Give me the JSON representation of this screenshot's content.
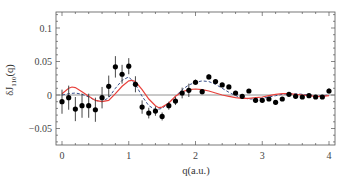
{
  "chart_data": {
    "type": "scatter",
    "title": "",
    "xlabel": "q(a.u.)",
    "ylabel": "δJ110(q)",
    "ylabel_main": "δJ",
    "ylabel_sub": "110",
    "ylabel_tail": "(q)",
    "xlim": [
      -0.08,
      4.1
    ],
    "ylim": [
      -0.075,
      0.125
    ],
    "grid": false,
    "legend": null,
    "x_ticks": [
      0,
      1,
      2,
      3,
      4
    ],
    "x_tick_labels": [
      "0",
      "1",
      "2",
      "3",
      "4"
    ],
    "y_ticks": [
      -0.05,
      0,
      0.05,
      0.1
    ],
    "y_tick_labels": [
      "-0.05",
      "0",
      "0.05",
      "0.1"
    ],
    "zero_line": true,
    "colors": {
      "data": "#000000",
      "model_solid": "#e8413c",
      "model_dashed": "#3a4f8a",
      "zero_line": "#777777",
      "frame": "#555555"
    },
    "series": [
      {
        "name": "experiment",
        "style": "points-with-errorbars",
        "x": [
          0.0,
          0.1,
          0.2,
          0.3,
          0.4,
          0.5,
          0.6,
          0.7,
          0.8,
          0.9,
          1.0,
          1.1,
          1.2,
          1.3,
          1.4,
          1.5,
          1.6,
          1.7,
          1.8,
          1.9,
          2.0,
          2.1,
          2.2,
          2.3,
          2.4,
          2.5,
          2.6,
          2.7,
          2.8,
          2.9,
          3.0,
          3.1,
          3.2,
          3.3,
          3.4,
          3.5,
          3.6,
          3.7,
          3.8,
          3.9,
          4.0
        ],
        "y": [
          -0.01,
          -0.004,
          -0.021,
          -0.016,
          -0.016,
          -0.022,
          -0.004,
          0.013,
          0.042,
          0.031,
          0.043,
          0.016,
          -0.018,
          -0.027,
          -0.024,
          -0.032,
          -0.016,
          -0.009,
          0.003,
          0.007,
          0.019,
          0.005,
          0.027,
          0.02,
          0.015,
          0.012,
          0.003,
          -0.002,
          0.006,
          -0.008,
          -0.008,
          -0.006,
          -0.011,
          -0.006,
          0.001,
          -0.002,
          -0.003,
          -0.001,
          -0.003,
          -0.003,
          0.006
        ],
        "yerr": [
          0.018,
          0.018,
          0.018,
          0.018,
          0.018,
          0.018,
          0.016,
          0.016,
          0.016,
          0.014,
          0.012,
          0.012,
          0.01,
          0.008,
          0.007,
          0.006,
          0.006,
          0.006,
          0.008,
          0.01,
          0.004,
          0.004,
          0.004,
          0.003,
          0.003,
          0.003,
          0.003,
          0.003,
          0.003,
          0.003,
          0.003,
          0.003,
          0.003,
          0.003,
          0.003,
          0.003,
          0.003,
          0.003,
          0.003,
          0.003,
          0.004
        ]
      },
      {
        "name": "model-solid",
        "style": "solid-line",
        "x": [
          0.0,
          0.1,
          0.15,
          0.2,
          0.3,
          0.4,
          0.5,
          0.6,
          0.7,
          0.8,
          0.9,
          1.0,
          1.05,
          1.1,
          1.2,
          1.3,
          1.4,
          1.45,
          1.5,
          1.6,
          1.7,
          1.8,
          1.9,
          2.0,
          2.1,
          2.2,
          2.3,
          2.4,
          2.5,
          2.6,
          2.7,
          2.8,
          2.9,
          3.0,
          3.1,
          3.2,
          3.3,
          3.4,
          3.5,
          3.6,
          3.7,
          3.8,
          3.9,
          4.0
        ],
        "y": [
          0.002,
          0.01,
          0.012,
          0.011,
          0.005,
          -0.002,
          -0.008,
          -0.01,
          -0.008,
          0.002,
          0.013,
          0.021,
          0.022,
          0.02,
          0.008,
          -0.006,
          -0.016,
          -0.019,
          -0.018,
          -0.012,
          -0.002,
          0.005,
          0.008,
          0.009,
          0.008,
          0.006,
          0.003,
          0.0,
          -0.002,
          -0.004,
          -0.005,
          -0.005,
          -0.004,
          -0.003,
          -0.001,
          0.001,
          0.002,
          0.002,
          0.001,
          0.0,
          -0.001,
          -0.002,
          -0.002,
          -0.001
        ]
      },
      {
        "name": "model-dashed",
        "style": "dashed-line",
        "x": [
          0.0,
          0.1,
          0.2,
          0.3,
          0.4,
          0.5,
          0.6,
          0.7,
          0.8,
          0.9,
          1.0,
          1.1,
          1.2,
          1.3,
          1.4,
          1.5,
          1.6,
          1.7,
          1.8,
          1.9,
          2.0,
          2.1,
          2.2,
          2.3,
          2.4,
          2.5,
          2.6,
          2.7,
          2.8,
          2.9,
          3.0,
          3.1,
          3.2,
          3.3,
          3.4,
          3.5,
          3.6,
          3.7,
          3.8,
          3.9,
          4.0
        ],
        "y": [
          0.0,
          0.002,
          0.003,
          0.001,
          -0.003,
          -0.008,
          -0.01,
          -0.004,
          0.01,
          0.022,
          0.027,
          0.016,
          -0.002,
          -0.016,
          -0.022,
          -0.02,
          -0.012,
          -0.002,
          0.008,
          0.015,
          0.019,
          0.021,
          0.02,
          0.016,
          0.01,
          0.004,
          -0.001,
          -0.004,
          -0.006,
          -0.006,
          -0.005,
          -0.003,
          -0.001,
          0.001,
          0.002,
          0.002,
          0.001,
          0.0,
          -0.001,
          -0.001,
          0.0
        ]
      }
    ]
  }
}
